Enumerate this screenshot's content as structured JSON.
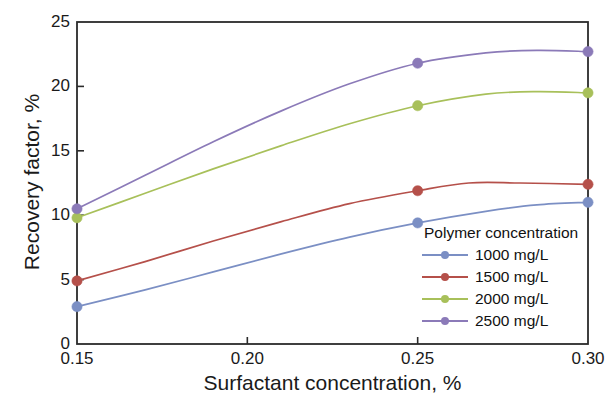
{
  "chart_data": {
    "type": "line",
    "title": "",
    "xlabel": "Surfactant concentration, %",
    "ylabel": "Recovery factor, %",
    "xlim": [
      0.15,
      0.3
    ],
    "ylim": [
      0,
      25
    ],
    "xticks": [
      "0.15",
      "0.20",
      "0.25",
      "0.30"
    ],
    "xtick_values": [
      0.15,
      0.2,
      0.25,
      0.3
    ],
    "yticks": [
      "0",
      "5",
      "10",
      "15",
      "20",
      "25"
    ],
    "ytick_values": [
      0,
      5,
      10,
      15,
      20,
      25
    ],
    "grid": false,
    "legend_position": "inside lower right",
    "legend_title": "Polymer concentration",
    "markers": "circle",
    "x": [
      0.15,
      0.25,
      0.3
    ],
    "series": [
      {
        "name": "1000 mg/L",
        "color": "#7b8fc4",
        "values": [
          2.9,
          9.4,
          11.0
        ],
        "curve": [
          {
            "x": 0.15,
            "y": 2.9
          },
          {
            "x": 0.17,
            "y": 4.2
          },
          {
            "x": 0.19,
            "y": 5.6
          },
          {
            "x": 0.21,
            "y": 7.0
          },
          {
            "x": 0.23,
            "y": 8.3
          },
          {
            "x": 0.25,
            "y": 9.4
          },
          {
            "x": 0.27,
            "y": 10.3
          },
          {
            "x": 0.285,
            "y": 10.8
          },
          {
            "x": 0.3,
            "y": 11.0
          }
        ]
      },
      {
        "name": "1500 mg/L",
        "color": "#b5504a",
        "values": [
          4.9,
          11.9,
          12.4
        ],
        "curve": [
          {
            "x": 0.15,
            "y": 4.9
          },
          {
            "x": 0.17,
            "y": 6.4
          },
          {
            "x": 0.19,
            "y": 8.0
          },
          {
            "x": 0.21,
            "y": 9.5
          },
          {
            "x": 0.23,
            "y": 10.9
          },
          {
            "x": 0.25,
            "y": 11.9
          },
          {
            "x": 0.265,
            "y": 12.5
          },
          {
            "x": 0.28,
            "y": 12.5
          },
          {
            "x": 0.3,
            "y": 12.4
          }
        ]
      },
      {
        "name": "2000 mg/L",
        "color": "#a8c05a",
        "values": [
          9.8,
          18.5,
          19.5
        ],
        "curve": [
          {
            "x": 0.15,
            "y": 9.8
          },
          {
            "x": 0.17,
            "y": 11.7
          },
          {
            "x": 0.19,
            "y": 13.6
          },
          {
            "x": 0.21,
            "y": 15.4
          },
          {
            "x": 0.23,
            "y": 17.1
          },
          {
            "x": 0.25,
            "y": 18.5
          },
          {
            "x": 0.27,
            "y": 19.4
          },
          {
            "x": 0.285,
            "y": 19.6
          },
          {
            "x": 0.3,
            "y": 19.5
          }
        ]
      },
      {
        "name": "2500 mg/L",
        "color": "#8b7ab8",
        "values": [
          10.5,
          21.8,
          22.7
        ],
        "curve": [
          {
            "x": 0.15,
            "y": 10.5
          },
          {
            "x": 0.17,
            "y": 13.1
          },
          {
            "x": 0.19,
            "y": 15.7
          },
          {
            "x": 0.21,
            "y": 18.1
          },
          {
            "x": 0.23,
            "y": 20.2
          },
          {
            "x": 0.25,
            "y": 21.8
          },
          {
            "x": 0.27,
            "y": 22.6
          },
          {
            "x": 0.285,
            "y": 22.8
          },
          {
            "x": 0.3,
            "y": 22.7
          }
        ]
      }
    ]
  },
  "legend": {
    "title": "Polymer concentration",
    "items": [
      {
        "label": "1000 mg/L",
        "color": "#7b8fc4"
      },
      {
        "label": "1500 mg/L",
        "color": "#b5504a"
      },
      {
        "label": "2000 mg/L",
        "color": "#a8c05a"
      },
      {
        "label": "2500 mg/L",
        "color": "#8b7ab8"
      }
    ]
  }
}
